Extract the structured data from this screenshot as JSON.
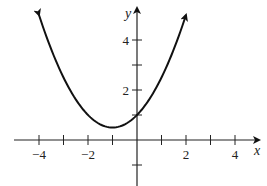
{
  "chart_data": {
    "type": "line",
    "title": "",
    "xlabel": "x",
    "ylabel": "y",
    "function": "y = 0.5(x+1)^2 + 0.5",
    "xlim": [
      -5,
      5
    ],
    "ylim": [
      -2,
      5
    ],
    "grid": false,
    "x_ticks": [
      -4,
      -3,
      -2,
      -1,
      0,
      1,
      2,
      3,
      4
    ],
    "x_tick_labels": [
      {
        "value": -4,
        "label": "−4"
      },
      {
        "value": -2,
        "label": "−2"
      },
      {
        "value": 2,
        "label": "2"
      },
      {
        "value": 4,
        "label": "4"
      }
    ],
    "y_ticks": [
      -1,
      1,
      2,
      3,
      4
    ],
    "y_tick_labels": [
      {
        "value": 2,
        "label": "2"
      },
      {
        "value": 4,
        "label": "4"
      }
    ],
    "series": [
      {
        "name": "parabola",
        "x": [
          -4,
          -3.5,
          -3,
          -2.5,
          -2,
          -1.5,
          -1,
          -0.5,
          0,
          0.5,
          1,
          1.5,
          2
        ],
        "values": [
          5,
          3.625,
          2.5,
          1.625,
          1,
          0.625,
          0.5,
          0.625,
          1,
          1.625,
          2.5,
          3.625,
          5
        ]
      }
    ],
    "vertex": [
      -1,
      0.5
    ],
    "y_intercept": 1,
    "arrows_on_ends": true
  },
  "labels": {
    "x_axis": "x",
    "y_axis": "y"
  },
  "colors": {
    "curve": "#111111",
    "axis": "#222222"
  }
}
